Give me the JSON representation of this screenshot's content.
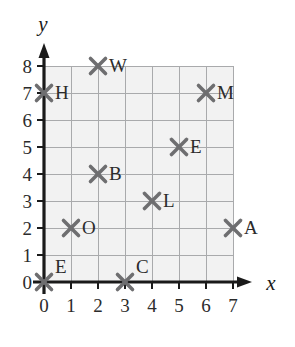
{
  "figure": {
    "kind": "coordinate-plane-scatter",
    "background_color": "#ffffff",
    "grid_fill_color": "#f2f2f2",
    "grid_line_color": "#a9aaac",
    "axis_color": "#1a1a1a",
    "marker_color": "#6e6e70",
    "label_color": "#2b2b2b"
  },
  "axes": {
    "x_label": "x",
    "y_label": "y",
    "x_ticks": [
      "0",
      "1",
      "2",
      "3",
      "4",
      "5",
      "6",
      "7"
    ],
    "y_ticks": [
      "0",
      "1",
      "2",
      "3",
      "4",
      "5",
      "6",
      "7",
      "8"
    ],
    "x_range": [
      0,
      7
    ],
    "y_range": [
      0,
      8
    ],
    "grid": true
  },
  "chart_data": {
    "type": "scatter",
    "title": "",
    "xlabel": "x",
    "ylabel": "y",
    "xlim": [
      0,
      7
    ],
    "ylim": [
      0,
      8
    ],
    "grid": true,
    "legend": "none",
    "marker": "x",
    "categories": [
      "W",
      "H",
      "M",
      "E",
      "B",
      "L",
      "O",
      "A",
      "E",
      "C"
    ],
    "points": [
      {
        "label": "W",
        "x": 2,
        "y": 8,
        "label_dx": 11,
        "label_dy": 6
      },
      {
        "label": "H",
        "x": 0,
        "y": 7,
        "label_dx": 11,
        "label_dy": 6
      },
      {
        "label": "M",
        "x": 6,
        "y": 7,
        "label_dx": 11,
        "label_dy": 6
      },
      {
        "label": "E",
        "x": 5,
        "y": 5,
        "label_dx": 11,
        "label_dy": 6
      },
      {
        "label": "B",
        "x": 2,
        "y": 4,
        "label_dx": 11,
        "label_dy": 6
      },
      {
        "label": "L",
        "x": 4,
        "y": 3,
        "label_dx": 11,
        "label_dy": 6
      },
      {
        "label": "O",
        "x": 1,
        "y": 2,
        "label_dx": 11,
        "label_dy": 6
      },
      {
        "label": "A",
        "x": 7,
        "y": 2,
        "label_dx": 11,
        "label_dy": 6
      },
      {
        "label": "E",
        "x": 0,
        "y": 0,
        "label_dx": 11,
        "label_dy": -9
      },
      {
        "label": "C",
        "x": 3,
        "y": 0,
        "label_dx": 11,
        "label_dy": -9
      }
    ],
    "series": [
      {
        "name": "plotted-points",
        "x": [
          2,
          0,
          6,
          5,
          2,
          4,
          1,
          7,
          0,
          3
        ],
        "values": [
          8,
          7,
          7,
          5,
          4,
          3,
          2,
          2,
          0,
          0
        ]
      }
    ]
  }
}
